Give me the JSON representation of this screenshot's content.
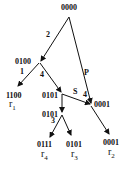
{
  "diagram": {
    "nodes": [
      {
        "id": "root",
        "label": "0000"
      },
      {
        "id": "n0100",
        "label": "0100"
      },
      {
        "id": "n1100",
        "label": "1100",
        "result": "r",
        "result_sub": "1"
      },
      {
        "id": "n0101a",
        "label": "0101"
      },
      {
        "id": "n0001mid",
        "label": "0001"
      },
      {
        "id": "n0101b",
        "label": "0101"
      },
      {
        "id": "n0111",
        "label": "0111",
        "result": "r",
        "result_sub": "4"
      },
      {
        "id": "n0101c",
        "label": "0101",
        "result": "r",
        "result_sub": "3"
      },
      {
        "id": "n0001r2",
        "label": "0001",
        "result": "r",
        "result_sub": "2"
      }
    ],
    "edge_labels": {
      "root_to_0100": "2",
      "root_to_0001": "P",
      "n0100_to_1100": "1",
      "n0100_to_0101": "4",
      "n0101_to_0001": "S",
      "n0001_in": "4",
      "n0101b_to_0111": "3"
    }
  }
}
